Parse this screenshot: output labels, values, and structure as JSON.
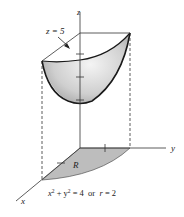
{
  "figure": {
    "type": "3d-solid-diagram",
    "colors": {
      "surface_fill": "#c8c8c8",
      "surface_highlight": "#f2f2f2",
      "region_fill": "#bdbdbd",
      "line": "#1a1a1a"
    }
  },
  "labels": {
    "z_axis": "z",
    "y_axis": "y",
    "x_axis": "x",
    "plane": "z = 5",
    "region": "R",
    "equation_lhs": "x",
    "equation_sup1": "2",
    "equation_mid": " + y",
    "equation_sup2": "2",
    "equation_rhs": " = 4  or  ",
    "equation_r": "r",
    "equation_end": " = 2"
  }
}
